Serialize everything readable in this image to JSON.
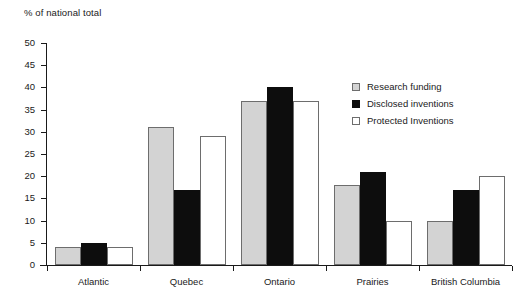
{
  "chart_data": {
    "type": "bar",
    "title": "",
    "subtitle": "",
    "xlabel": "",
    "ylabel": "% of national total",
    "categories": [
      "Atlantic",
      "Quebec",
      "Ontario",
      "Prairies",
      "British Columbia"
    ],
    "series": [
      {
        "name": "Research funding",
        "values": [
          4,
          31,
          37,
          18,
          10
        ],
        "color": "#d3d3d3"
      },
      {
        "name": "Disclosed inventions",
        "values": [
          5,
          17,
          40,
          21,
          17
        ],
        "color": "#0d0d0d"
      },
      {
        "name": "Protected Inventions",
        "values": [
          4,
          29,
          37,
          10,
          20
        ],
        "color": "#ffffff"
      }
    ],
    "ylim": [
      0,
      50
    ],
    "ytick_step": 5,
    "ytick_labels": [
      "0",
      "5",
      "10",
      "15",
      "20",
      "25",
      "30",
      "35",
      "40",
      "45",
      "50"
    ],
    "grid": false,
    "legend_position": "upper right"
  }
}
